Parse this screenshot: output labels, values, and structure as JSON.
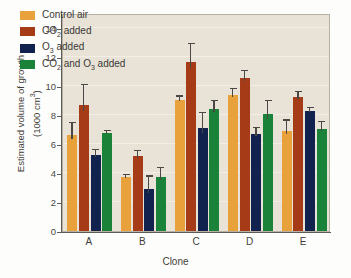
{
  "chart_data": {
    "type": "bar",
    "title": "",
    "xlabel": "Clone",
    "ylabel_line1": "Estimated volume of growth",
    "ylabel_line2": "(1000 cm",
    "ylabel_line2_sup": "3",
    "ylabel_line2_end": ")",
    "categories": [
      "A",
      "B",
      "C",
      "D",
      "E"
    ],
    "ylim": [
      0,
      15
    ],
    "yticks": [
      0,
      2,
      4,
      6,
      8,
      10,
      12,
      14
    ],
    "ytick_labels": [
      "0",
      "2",
      "4",
      "6",
      "8",
      "10",
      "12",
      "14"
    ],
    "grid": true,
    "legend_position": "top-left",
    "series": [
      {
        "name": "Control air",
        "color": "#e9a13b",
        "values": [
          6.6,
          3.7,
          9.0,
          9.35,
          6.9
        ],
        "errors": [
          0.85,
          0.15,
          0.25,
          0.4,
          0.7
        ]
      },
      {
        "name": "CO2 added",
        "label_parts": {
          "pre": "CO",
          "sub": "2",
          "post": " added"
        },
        "color": "#a63c17",
        "values": [
          8.7,
          5.15,
          11.65,
          10.5,
          9.2
        ],
        "errors": [
          1.35,
          0.35,
          1.2,
          0.5,
          0.35
        ]
      },
      {
        "name": "O3 added",
        "label_parts": {
          "pre": "O",
          "sub": "3",
          "post": " added"
        },
        "color": "#11224f",
        "values": [
          5.2,
          2.9,
          7.1,
          6.7,
          8.25
        ],
        "errors": [
          0.35,
          0.85,
          1.0,
          0.4,
          0.2
        ]
      },
      {
        "name": "CO2 and O3 added",
        "label_parts": {
          "pre": "CO",
          "sub": "2",
          "mid": " and O",
          "sub2": "3",
          "post": " added"
        },
        "color": "#1a8239",
        "values": [
          6.75,
          3.75,
          8.4,
          8.05,
          7.05
        ],
        "errors": [
          0.15,
          0.6,
          0.55,
          0.9,
          0.45
        ]
      }
    ]
  },
  "legend": {
    "items": [
      {
        "label": "Control air",
        "color": "#e9a13b"
      },
      {
        "label": "CO2 added",
        "color": "#a63c17"
      },
      {
        "label": "O3 added",
        "color": "#11224f"
      },
      {
        "label": "CO2 and O3 added",
        "color": "#1a8239"
      }
    ]
  }
}
